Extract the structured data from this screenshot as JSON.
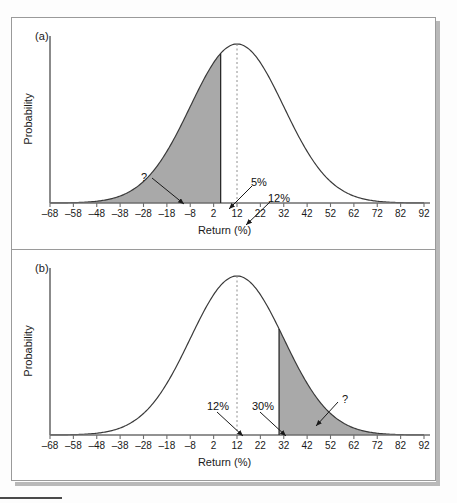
{
  "figure": {
    "panels": [
      {
        "id": "a",
        "label": "(a)",
        "ylabel": "Probability",
        "xlabel": "Return (%)",
        "shade_side": "left",
        "shade_bound": 5,
        "annotations": [
          {
            "text": "?",
            "name": "question-mark-a",
            "x": 129,
            "y": 153,
            "ax1": 140,
            "ay1": 160,
            "ax2": 172,
            "ay2": 186
          },
          {
            "text": "5%",
            "name": "five-percent-a",
            "x": 239,
            "y": 158,
            "ax1": 240,
            "ay1": 168,
            "ax2": 217,
            "ay2": 191
          },
          {
            "text": "12%",
            "name": "twelve-percent-a",
            "x": 256,
            "y": 174,
            "ax1": 258,
            "ay1": 184,
            "ax2": 234,
            "ay2": 207
          }
        ]
      },
      {
        "id": "b",
        "label": "(b)",
        "ylabel": "Probability",
        "xlabel": "Return (%)",
        "shade_side": "right",
        "shade_bound": 30,
        "annotations": [
          {
            "text": "12%",
            "name": "twelve-percent-b",
            "x": 195,
            "y": 150,
            "ax1": 205,
            "ay1": 162,
            "ax2": 231,
            "ay2": 186
          },
          {
            "text": "30%",
            "name": "thirty-percent-b",
            "x": 240,
            "y": 150,
            "ax1": 248,
            "ay1": 162,
            "ax2": 274,
            "ay2": 186
          },
          {
            "text": "?",
            "name": "question-mark-b",
            "x": 330,
            "y": 143,
            "ax1": 326,
            "ay1": 152,
            "ax2": 304,
            "ay2": 176
          }
        ]
      }
    ],
    "colors": {
      "shade_fill": "#a9a9a9",
      "curve": "#3a3a3a",
      "axis": "#6e6e6e",
      "mean_line": "#8e8e8e",
      "text": "#1a1a1a",
      "frame": "#9a9a9a",
      "shadow": "#b9b9b9"
    }
  },
  "chart_data": {
    "type": "line",
    "title": "",
    "xlabel": "Return (%)",
    "ylabel": "Probability",
    "xlim": [
      -68,
      92
    ],
    "ylim": [
      0,
      1
    ],
    "xticks": [
      -68,
      -58,
      -48,
      -38,
      -28,
      -18,
      -8,
      2,
      12,
      22,
      32,
      42,
      52,
      62,
      72,
      82,
      92
    ],
    "xticklabels": [
      "–68",
      "–58",
      "–48",
      "–38",
      "–28",
      "–18",
      "–8",
      "2",
      "12",
      "22",
      "32",
      "42",
      "52",
      "62",
      "72",
      "82",
      "92"
    ],
    "yticks": [],
    "yticklabels": [],
    "grid": false,
    "legend": null,
    "distribution": {
      "family": "normal",
      "mean": 12,
      "std_dev": 20
    },
    "series": [
      {
        "name": "Normal distribution of returns (panel a)",
        "panel": "a",
        "mean": 12,
        "std_dev": 20,
        "shaded_region": {
          "from": -68,
          "to": 5,
          "side": "left",
          "fill": "#a9a9a9"
        },
        "mean_marker": {
          "value": 12,
          "style": "dashed-vertical"
        },
        "boundary_marker": {
          "value": 5,
          "style": "solid-vertical"
        },
        "annotations": [
          "?",
          "5%",
          "12%"
        ]
      },
      {
        "name": "Normal distribution of returns (panel b)",
        "panel": "b",
        "mean": 12,
        "std_dev": 20,
        "shaded_region": {
          "from": 30,
          "to": 92,
          "side": "right",
          "fill": "#a9a9a9"
        },
        "mean_marker": {
          "value": 12,
          "style": "dashed-vertical"
        },
        "boundary_marker": {
          "value": 30,
          "style": "solid-vertical"
        },
        "annotations": [
          "12%",
          "30%",
          "?"
        ]
      }
    ]
  }
}
